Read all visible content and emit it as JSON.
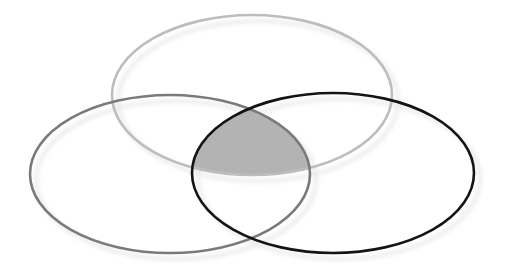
{
  "diagram": {
    "type": "venn",
    "set_count": 3,
    "background": "#ffffff",
    "sets": [
      {
        "id": "top",
        "cx": 252,
        "cy": 95,
        "rx": 140,
        "ry": 80,
        "stroke": "#bdbdbd",
        "stroke_width": 2.6
      },
      {
        "id": "left",
        "cx": 170,
        "cy": 174,
        "rx": 140,
        "ry": 79,
        "stroke": "#7a7a7a",
        "stroke_width": 2.6
      },
      {
        "id": "right",
        "cx": 333,
        "cy": 173,
        "rx": 141,
        "ry": 80,
        "stroke": "#141414",
        "stroke_width": 2.6
      }
    ],
    "highlight": {
      "region": "intersection-all-three",
      "fill": "#b3b3b3"
    },
    "shadow": {
      "color": "#e6e6e6",
      "dx": 6,
      "dy": 6,
      "blur": 2
    },
    "labels": []
  }
}
